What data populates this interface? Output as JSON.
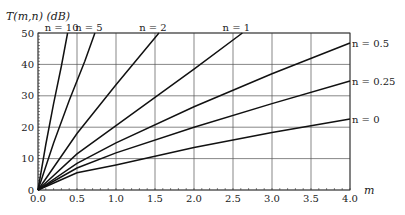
{
  "chart_data": {
    "type": "line",
    "title": "",
    "ylabel": "T(m,n) (dB)",
    "xlabel": "m",
    "xlim": [
      0,
      4
    ],
    "ylim": [
      0,
      50
    ],
    "xticks": [
      "0.0",
      "0.5",
      "1.0",
      "1.5",
      "2.0",
      "2.5",
      "3.0",
      "3.5",
      "4.0"
    ],
    "yticks": [
      "0",
      "10",
      "20",
      "30",
      "40",
      "50"
    ],
    "grid": true,
    "series": [
      {
        "name": "n = 10",
        "label_pos": "top",
        "points": [
          [
            0,
            0
          ],
          [
            0.1,
            14.5
          ],
          [
            0.2,
            27.5
          ],
          [
            0.3,
            39.5
          ],
          [
            0.38,
            50
          ]
        ]
      },
      {
        "name": "n = 5",
        "label_pos": "top",
        "points": [
          [
            0,
            0
          ],
          [
            0.2,
            15
          ],
          [
            0.4,
            28.5
          ],
          [
            0.6,
            41
          ],
          [
            0.73,
            50
          ]
        ]
      },
      {
        "name": "n = 2",
        "label_pos": "top",
        "points": [
          [
            0,
            0
          ],
          [
            0.5,
            18
          ],
          [
            1.0,
            33.5
          ],
          [
            1.5,
            48.5
          ],
          [
            1.55,
            50
          ]
        ]
      },
      {
        "name": "n = 1",
        "label_pos": "top",
        "points": [
          [
            0,
            0
          ],
          [
            0.5,
            11.5
          ],
          [
            1.0,
            20.5
          ],
          [
            1.5,
            29.5
          ],
          [
            2.0,
            38.5
          ],
          [
            2.62,
            50
          ]
        ]
      },
      {
        "name": "n = 0.5",
        "label_pos": "right",
        "points": [
          [
            0,
            0
          ],
          [
            0.5,
            8.5
          ],
          [
            1.0,
            15
          ],
          [
            2.0,
            26.5
          ],
          [
            3.0,
            37
          ],
          [
            4.0,
            46.8
          ]
        ]
      },
      {
        "name": "n = 0.25",
        "label_pos": "right",
        "points": [
          [
            0,
            0
          ],
          [
            0.5,
            7
          ],
          [
            1.0,
            11.8
          ],
          [
            2.0,
            20
          ],
          [
            3.0,
            27.5
          ],
          [
            4.0,
            34.7
          ]
        ]
      },
      {
        "name": "n = 0",
        "label_pos": "right",
        "points": [
          [
            0,
            0
          ],
          [
            0.5,
            5.5
          ],
          [
            1.0,
            8
          ],
          [
            2.0,
            13.5
          ],
          [
            3.0,
            18.3
          ],
          [
            4.0,
            22.6
          ]
        ]
      }
    ]
  }
}
